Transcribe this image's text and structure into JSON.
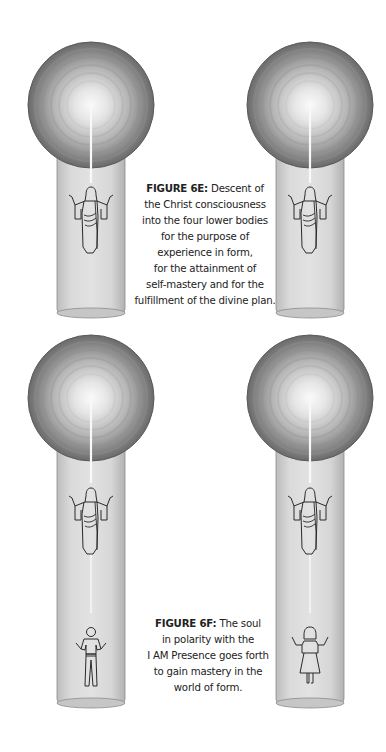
{
  "figure_6e": {
    "label": "FIGURE 6E:",
    "lines": [
      " Descent of",
      "the Christ consciousness",
      "into the four lower bodies",
      "for the purpose of",
      "experience in form,",
      "for the attainment of",
      "self-mastery and for the",
      "fulfillment of the divine plan."
    ]
  },
  "figure_6f": {
    "label": "FIGURE 6F:",
    "lines": [
      " The soul",
      "in polarity with the",
      "I AM Presence goes forth",
      "to gain mastery in the",
      "world of form."
    ]
  },
  "illustrations": [
    {
      "name": "top-left",
      "figures": [
        "christ-figure"
      ]
    },
    {
      "name": "top-right",
      "figures": [
        "christ-figure"
      ]
    },
    {
      "name": "bottom-left",
      "figures": [
        "christ-figure",
        "man-figure"
      ]
    },
    {
      "name": "bottom-right",
      "figures": [
        "christ-figure",
        "woman-figure"
      ]
    }
  ],
  "colors": {
    "sphere_dark": "#6e6e6e",
    "sphere_light": "#f4f4f4",
    "column": "#d6d6d6",
    "ray": "#f6f6f6",
    "outline": "#2a2a2a"
  }
}
